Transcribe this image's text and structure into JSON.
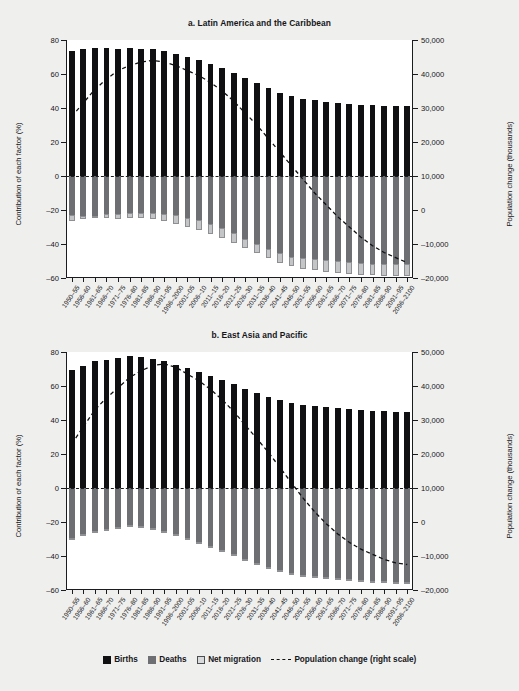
{
  "figure": {
    "background": "#efefed",
    "plot_background": "#ffffff"
  },
  "legend": {
    "items": [
      {
        "label": "Births",
        "color": "#101012",
        "swatch": "filled-square"
      },
      {
        "label": "Deaths",
        "color": "#6d6f72",
        "swatch": "filled-square"
      },
      {
        "label": "Net migration",
        "color": "#d8dadb",
        "swatch": "outlined-square"
      },
      {
        "label": "Population change (right scale)",
        "color": "#101012",
        "swatch": "dashed-line"
      }
    ]
  },
  "chart_data": [
    {
      "type": "bar",
      "id": "panel-a",
      "title": "a. Latin America and the Caribbean",
      "xlabel": "",
      "ylabel": "Contribution of each factor (%)",
      "y2label": "Population change (thousands)",
      "ylim": [
        -60,
        80
      ],
      "yticks": [
        -60,
        -40,
        -20,
        0,
        20,
        40,
        60,
        80
      ],
      "ytick_labels": [
        "–60",
        "–40",
        "–20",
        "0",
        "20",
        "40",
        "60",
        "80"
      ],
      "y2lim": [
        -20000,
        50000
      ],
      "y2ticks": [
        -20000,
        -10000,
        0,
        10000,
        20000,
        30000,
        40000,
        50000
      ],
      "y2tick_labels": [
        "–20,000",
        "–10,000",
        "0",
        "10,000",
        "20,000",
        "30,000",
        "40,000",
        "50,000"
      ],
      "grid": false,
      "legend_position": "bottom",
      "zero_reference_line": 0,
      "categories": [
        "1950–55",
        "1956–60",
        "1961–65",
        "1966–70",
        "1971–75",
        "1976–80",
        "1981–85",
        "1986–90",
        "1991–95",
        "1996–2000",
        "2001–05",
        "2006–10",
        "2011–15",
        "2016–20",
        "2021–25",
        "2026–30",
        "2031–35",
        "2036–40",
        "2041–45",
        "2046–50",
        "2051–55",
        "2056–60",
        "2061–65",
        "2066–70",
        "2071–75",
        "2076–80",
        "2081–85",
        "2086–90",
        "2091–95",
        "2096–2100"
      ],
      "series": [
        {
          "name": "Births",
          "color": "#101012",
          "values": [
            73.5,
            74.5,
            75.5,
            75.5,
            75.0,
            75.5,
            75.0,
            74.5,
            73.5,
            72.0,
            70.0,
            68.0,
            66.0,
            63.5,
            60.5,
            57.5,
            54.5,
            51.5,
            49.0,
            47.0,
            45.5,
            44.5,
            43.5,
            43.0,
            42.5,
            42.0,
            41.5,
            41.0,
            41.0,
            41.0
          ]
        },
        {
          "name": "Deaths",
          "color": "#6d6f72",
          "values": [
            -23.0,
            -23.5,
            -23.5,
            -22.5,
            -22.5,
            -22.0,
            -22.0,
            -22.0,
            -22.5,
            -23.0,
            -24.5,
            -26.0,
            -28.0,
            -30.5,
            -33.5,
            -37.0,
            -40.0,
            -43.0,
            -45.5,
            -47.5,
            -48.5,
            -49.0,
            -49.5,
            -50.0,
            -50.5,
            -51.0,
            -51.5,
            -52.0,
            -52.0,
            -52.0
          ]
        },
        {
          "name": "Net migration",
          "color": "#c3c5c7",
          "values": [
            -3.5,
            -2.0,
            -1.5,
            -2.0,
            -2.5,
            -2.5,
            -3.0,
            -3.5,
            -4.0,
            -5.0,
            -5.5,
            -6.0,
            -6.0,
            -6.0,
            -6.0,
            -5.5,
            -5.5,
            -5.5,
            -5.5,
            -5.5,
            -6.0,
            -6.5,
            -7.0,
            -7.0,
            -7.0,
            -7.0,
            -7.0,
            -7.0,
            -7.0,
            -7.0
          ]
        }
      ],
      "line_series": {
        "name": "Population change (right scale)",
        "axis": "right",
        "style": "dashed",
        "color": "#101012",
        "values": [
          27500,
          31500,
          35500,
          38500,
          41000,
          42500,
          43500,
          44000,
          43500,
          42500,
          41000,
          39500,
          37500,
          35000,
          32000,
          28500,
          25000,
          21000,
          17000,
          13000,
          9000,
          5000,
          1500,
          -2000,
          -5000,
          -8000,
          -10500,
          -12500,
          -14000,
          -15500
        ]
      }
    },
    {
      "type": "bar",
      "id": "panel-b",
      "title": "b. East Asia and Pacific",
      "xlabel": "",
      "ylabel": "Contribution of each factor (%)",
      "y2label": "Population change (thousands)",
      "ylim": [
        -60,
        80
      ],
      "yticks": [
        -60,
        -40,
        -20,
        0,
        20,
        40,
        60,
        80
      ],
      "ytick_labels": [
        "–60",
        "–40",
        "–20",
        "0",
        "20",
        "40",
        "60",
        "80"
      ],
      "y2lim": [
        -20000,
        50000
      ],
      "y2ticks": [
        -20000,
        -10000,
        0,
        10000,
        20000,
        30000,
        40000,
        50000
      ],
      "y2tick_labels": [
        "–20,000",
        "–10,000",
        "0",
        "10,000",
        "20,000",
        "30,000",
        "40,000",
        "50,000"
      ],
      "grid": false,
      "legend_position": "bottom",
      "zero_reference_line": 0,
      "categories": [
        "1950–55",
        "1956–60",
        "1961–65",
        "1966–70",
        "1971–75",
        "1976–80",
        "1981–85",
        "1986–90",
        "1991–95",
        "1996–2000",
        "2001–05",
        "2006–10",
        "2011–15",
        "2016–20",
        "2021–25",
        "2026–30",
        "2031–35",
        "2036–40",
        "2041–45",
        "2046–50",
        "2051–55",
        "2056–60",
        "2061–65",
        "2066–70",
        "2071–75",
        "2076–80",
        "2081–85",
        "2086–90",
        "2091–95",
        "2096–2100"
      ],
      "series": [
        {
          "name": "Births",
          "color": "#101012",
          "values": [
            69.5,
            72.0,
            74.5,
            75.5,
            76.5,
            77.5,
            77.0,
            76.0,
            74.5,
            72.5,
            70.5,
            68.5,
            66.0,
            63.5,
            61.0,
            58.5,
            56.0,
            53.5,
            51.5,
            50.0,
            49.0,
            48.0,
            47.5,
            47.0,
            46.5,
            46.0,
            45.5,
            45.5,
            45.0,
            45.0
          ]
        },
        {
          "name": "Deaths",
          "color": "#6d6f72",
          "values": [
            -29.5,
            -27.0,
            -25.0,
            -24.0,
            -23.0,
            -22.0,
            -22.5,
            -23.5,
            -25.0,
            -27.0,
            -29.5,
            -31.5,
            -34.0,
            -36.5,
            -39.0,
            -41.5,
            -44.0,
            -46.5,
            -48.5,
            -50.0,
            -51.0,
            -52.0,
            -52.5,
            -53.0,
            -53.5,
            -54.0,
            -54.5,
            -54.5,
            -55.0,
            -55.0
          ]
        },
        {
          "name": "Net migration",
          "color": "#c3c5c7",
          "values": [
            -1.0,
            -1.0,
            -0.5,
            -0.5,
            -0.5,
            -0.5,
            -0.5,
            -0.5,
            -0.5,
            -0.5,
            -1.0,
            -1.0,
            -1.0,
            -1.0,
            -1.0,
            -1.0,
            -1.0,
            -1.0,
            -1.0,
            -1.0,
            -1.0,
            -1.0,
            -1.0,
            -1.0,
            -1.0,
            -1.0,
            -1.0,
            -1.0,
            -1.0,
            -1.0
          ]
        }
      ],
      "line_series": {
        "name": "Population change (right scale)",
        "axis": "right",
        "style": "dashed",
        "color": "#101012",
        "values": [
          23000,
          28000,
          33000,
          36500,
          39500,
          42500,
          44500,
          46000,
          46500,
          45500,
          43500,
          41500,
          39000,
          36000,
          32500,
          28500,
          24500,
          20500,
          16000,
          11500,
          7000,
          3000,
          -500,
          -3500,
          -6000,
          -8000,
          -9500,
          -11000,
          -12000,
          -12500
        ]
      }
    }
  ]
}
